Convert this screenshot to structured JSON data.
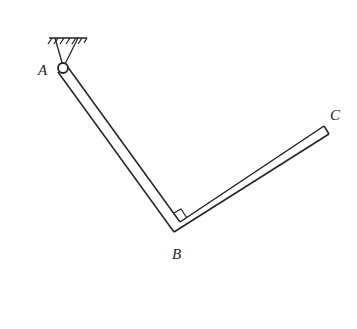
{
  "diagram": {
    "type": "mechanics-bent-bar",
    "labels": {
      "A": "A",
      "B": "B",
      "C": "C"
    },
    "right_angle_marker_at": "B",
    "stroke_color": "#222222",
    "background": "#ffffff"
  }
}
